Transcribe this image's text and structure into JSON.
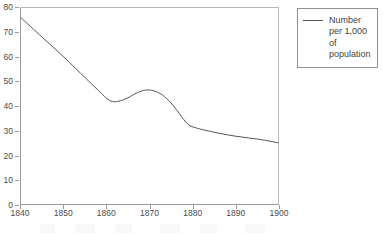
{
  "chart_data": {
    "type": "line",
    "title": "",
    "subtitle": "",
    "xlabel": "",
    "ylabel": "",
    "xlim": [
      1840,
      1900
    ],
    "ylim": [
      0,
      80
    ],
    "grid": false,
    "legend_position": "top-right",
    "x_ticks": [
      "1840",
      "1850",
      "1860",
      "1870",
      "1880",
      "1890",
      "1900"
    ],
    "x_tick_values": [
      1840,
      1850,
      1860,
      1870,
      1880,
      1890,
      1900
    ],
    "y_ticks": [
      "0",
      "10",
      "20",
      "30",
      "40",
      "50",
      "60",
      "70",
      "80"
    ],
    "y_tick_values": [
      0,
      10,
      20,
      30,
      40,
      50,
      60,
      70,
      80
    ],
    "series": [
      {
        "name": "Number per 1,000 of population",
        "color": "#555555",
        "x": [
          1840,
          1845,
          1850,
          1855,
          1858,
          1861,
          1864,
          1867,
          1869,
          1871,
          1873,
          1875,
          1877,
          1879,
          1881,
          1884,
          1887,
          1890,
          1893,
          1896,
          1900
        ],
        "values": [
          76.0,
          68.0,
          60.0,
          51.5,
          46.5,
          42.0,
          42.6,
          45.3,
          46.5,
          46.2,
          44.5,
          41.3,
          36.8,
          32.5,
          31.0,
          29.7,
          28.6,
          27.7,
          27.0,
          26.3,
          25.0
        ]
      }
    ],
    "annotations": []
  },
  "legend": {
    "entries": [
      {
        "swatch": "line-swatch",
        "lines": [
          "Number",
          "per 1,000",
          "of",
          "population"
        ]
      }
    ]
  },
  "colors": {
    "line": "#555555",
    "axis": "#9a9a9a",
    "frame_light": "#b9b9b9",
    "text": "#4a4a4a",
    "legend_border": "#8f8f8f",
    "background": "#ffffff"
  }
}
